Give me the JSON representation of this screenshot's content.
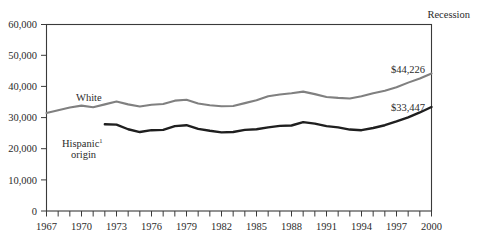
{
  "chart_data": {
    "type": "line",
    "title": "",
    "xlabel": "",
    "ylabel": "",
    "xlim": [
      1967,
      2000
    ],
    "ylim": [
      0,
      60000
    ],
    "grid": false,
    "legend_position": "inline-labels",
    "annotations": [
      {
        "name": "recession-label",
        "text": "Recession"
      },
      {
        "name": "white-endpoint-value",
        "text": "$44,226"
      },
      {
        "name": "hispanic-endpoint-value",
        "text": "$33,447"
      }
    ],
    "ytick_labels": [
      "0",
      "10,000",
      "20,000",
      "30,000",
      "40,000",
      "50,000",
      "60,000"
    ],
    "ytick_values": [
      0,
      10000,
      20000,
      30000,
      40000,
      50000,
      60000
    ],
    "xtick_labels": [
      "1967",
      "1970",
      "1973",
      "1976",
      "1979",
      "1982",
      "1985",
      "1988",
      "1991",
      "1994",
      "1997",
      "2000"
    ],
    "xtick_values": [
      1967,
      1970,
      1973,
      1976,
      1979,
      1982,
      1985,
      1988,
      1991,
      1994,
      1997,
      2000
    ],
    "x_minor_ticks_every": 1,
    "series": [
      {
        "name": "White",
        "label": "White",
        "color": "#808080",
        "end_value_label": "$44,226",
        "x": [
          1967,
          1968,
          1969,
          1970,
          1971,
          1972,
          1973,
          1974,
          1975,
          1976,
          1977,
          1978,
          1979,
          1980,
          1981,
          1982,
          1983,
          1984,
          1985,
          1986,
          1987,
          1988,
          1989,
          1990,
          1991,
          1992,
          1993,
          1994,
          1995,
          1996,
          1997,
          1998,
          1999,
          2000
        ],
        "values": [
          31500,
          32400,
          33300,
          33900,
          33400,
          34300,
          35200,
          34300,
          33600,
          34200,
          34400,
          35500,
          35800,
          34600,
          34000,
          33700,
          33800,
          34700,
          35600,
          36900,
          37500,
          37900,
          38400,
          37600,
          36700,
          36400,
          36200,
          36900,
          37900,
          38700,
          39800,
          41300,
          42600,
          44226
        ]
      },
      {
        "name": "Hispanic origin",
        "label": "Hispanic origin",
        "label_footnote": "1",
        "color": "#1f1f1f",
        "end_value_label": "$33,447",
        "x": [
          1972,
          1973,
          1974,
          1975,
          1976,
          1977,
          1978,
          1979,
          1980,
          1981,
          1982,
          1983,
          1984,
          1985,
          1986,
          1987,
          1988,
          1989,
          1990,
          1991,
          1992,
          1993,
          1994,
          1995,
          1996,
          1997,
          1998,
          1999,
          2000
        ],
        "values": [
          27900,
          27800,
          26300,
          25400,
          26000,
          26100,
          27300,
          27600,
          26400,
          25800,
          25300,
          25400,
          26100,
          26300,
          26900,
          27400,
          27500,
          28600,
          28100,
          27300,
          26900,
          26200,
          26000,
          26700,
          27600,
          28800,
          30100,
          31700,
          33447
        ]
      }
    ]
  },
  "page": {
    "recession_label": "Recession",
    "series_label_white": "White",
    "series_label_hispanic": "Hispanic",
    "series_label_hispanic_footnote": "1",
    "series_label_hispanic_line2": "origin",
    "white_value_label": "$44,226",
    "hispanic_value_label": "$33,447"
  }
}
